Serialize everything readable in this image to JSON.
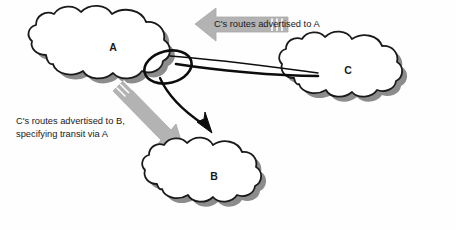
{
  "diagram": {
    "background_color": "#fefefe",
    "colors": {
      "cloud_fill": "#ffffff",
      "cloud_stroke": "#1a1a1a",
      "cloud_shadow": "#8c8c8c",
      "arrow_fill": "#b3b3b3",
      "arrow_stroke": "#a6a6a6",
      "arrow_stripe": "#ffffff",
      "path_stroke": "#0d0d0d",
      "text": "#1a1a1a"
    },
    "nodes": [
      {
        "id": "A",
        "label": "A",
        "name": "cloud-a",
        "cx": 113,
        "cy": 48
      },
      {
        "id": "C",
        "label": "C",
        "name": "cloud-c",
        "cx": 348,
        "cy": 71
      },
      {
        "id": "B",
        "label": "B",
        "name": "cloud-b",
        "cx": 214,
        "cy": 177
      }
    ],
    "annotations": [
      {
        "id": "to-a",
        "name": "annotation-routes-to-a",
        "lines": [
          "C's routes advertised to A"
        ],
        "x": 214,
        "y": 24,
        "arrow_direction": "left"
      },
      {
        "id": "to-b",
        "name": "annotation-routes-to-b",
        "lines": [
          "C's routes advertised to B,",
          "specifying transit via A"
        ],
        "x": 16,
        "y": 124,
        "arrow_direction": "down-right"
      }
    ],
    "paths": [
      {
        "id": "c-to-a",
        "name": "route-path-c-to-a",
        "from": "C",
        "to": "A",
        "style": "solid-loop"
      },
      {
        "id": "a-to-b",
        "name": "route-path-a-to-b",
        "from": "A",
        "to": "B",
        "style": "solid-arrow"
      }
    ]
  }
}
